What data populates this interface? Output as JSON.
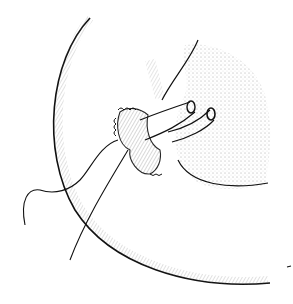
{
  "illustration": {
    "type": "surgical line drawing",
    "background": "#ffffff",
    "ink": "#111111",
    "elements": [
      "large curved organ outline",
      "stippled gland tissue",
      "anastomosed tubular structures",
      "sutured cuff",
      "suture thread with curved needle"
    ]
  }
}
